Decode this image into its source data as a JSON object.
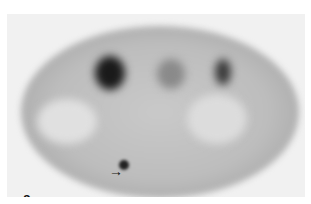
{
  "figure": {
    "panel_label": "a",
    "arrow_glyph": "→",
    "colors": {
      "background": "#ffffff",
      "panel": "#f1f1f1",
      "uptake_dark": "#111111"
    }
  }
}
